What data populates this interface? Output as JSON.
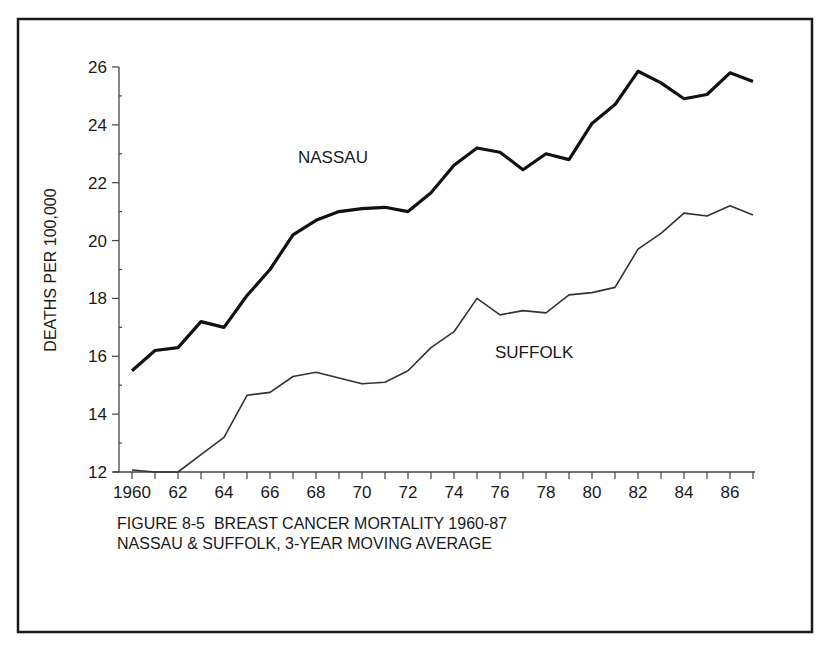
{
  "chart_data": {
    "type": "line",
    "title": "FIGURE 8-5  BREAST CANCER MORTALITY 1960-87",
    "subtitle": "NASSAU & SUFFOLK, 3-YEAR MOVING AVERAGE",
    "xlabel": "",
    "ylabel": "DEATHS PER 100,000",
    "xlim": [
      1960,
      1987
    ],
    "ylim": [
      12,
      26
    ],
    "grid": false,
    "legend": "inline labels",
    "x": [
      1960,
      1961,
      1962,
      1963,
      1964,
      1965,
      1966,
      1967,
      1968,
      1969,
      1970,
      1971,
      1972,
      1973,
      1974,
      1975,
      1976,
      1977,
      1978,
      1979,
      1980,
      1981,
      1982,
      1983,
      1984,
      1985,
      1986,
      1987
    ],
    "x_tick_labels": [
      "1960",
      "62",
      "64",
      "66",
      "68",
      "70",
      "72",
      "74",
      "76",
      "78",
      "80",
      "82",
      "84",
      "86"
    ],
    "y_tick_labels": [
      "12",
      "14",
      "16",
      "18",
      "20",
      "22",
      "24",
      "26"
    ],
    "series": [
      {
        "name": "NASSAU",
        "style": "thick",
        "values": [
          15.5,
          16.2,
          16.3,
          17.2,
          17.0,
          18.1,
          19.0,
          20.2,
          20.7,
          21.0,
          21.1,
          21.15,
          21.0,
          21.65,
          22.6,
          23.2,
          23.05,
          22.45,
          23.0,
          22.8,
          24.05,
          24.7,
          25.85,
          25.45,
          24.9,
          25.05,
          25.8,
          25.5
        ]
      },
      {
        "name": "SUFFOLK",
        "style": "thin",
        "values": [
          12.07,
          12.0,
          12.0,
          12.6,
          13.2,
          14.65,
          14.75,
          15.3,
          15.45,
          15.25,
          15.05,
          15.1,
          15.5,
          16.3,
          16.85,
          18.0,
          17.43,
          17.58,
          17.5,
          18.12,
          18.2,
          18.38,
          19.7,
          20.25,
          20.95,
          20.85,
          21.2,
          20.88
        ]
      }
    ],
    "annotations": [
      {
        "text": "NASSAU",
        "near_x": 1967.5,
        "near_y": 22.9
      },
      {
        "text": "SUFFOLK",
        "near_x": 1976.3,
        "near_y": 16.8
      }
    ]
  },
  "caption": {
    "line1": "FIGURE 8-5  BREAST CANCER MORTALITY 1960-87",
    "line2": "NASSAU & SUFFOLK, 3-YEAR MOVING AVERAGE"
  },
  "colors": {
    "ink": "#1a1a1a",
    "axis": "#444444",
    "background": "#ffffff"
  }
}
